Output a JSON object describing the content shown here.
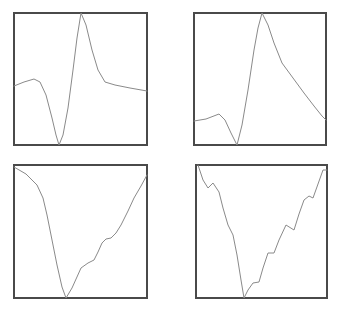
{
  "chart_data": [
    {
      "type": "line",
      "panel": "top-left",
      "title": "",
      "xlabel": "",
      "ylabel": "",
      "grid": false,
      "legend": null,
      "frame": {
        "x": 14,
        "y": 13,
        "w": 133,
        "h": 132
      },
      "points_px": [
        [
          14,
          86
        ],
        [
          24,
          82
        ],
        [
          34,
          79
        ],
        [
          40,
          82
        ],
        [
          46,
          95
        ],
        [
          52,
          118
        ],
        [
          56,
          135
        ],
        [
          59,
          145
        ],
        [
          63,
          135
        ],
        [
          68,
          108
        ],
        [
          73,
          70
        ],
        [
          77,
          38
        ],
        [
          81,
          13
        ],
        [
          86,
          25
        ],
        [
          92,
          50
        ],
        [
          98,
          70
        ],
        [
          105,
          82
        ],
        [
          115,
          85
        ],
        [
          130,
          88
        ],
        [
          147,
          91
        ]
      ],
      "description": "Smooth curve: small bump on left, deep trough, sharp peak, then gentle decay"
    },
    {
      "type": "line",
      "panel": "top-right",
      "title": "",
      "xlabel": "",
      "ylabel": "",
      "grid": false,
      "legend": null,
      "frame": {
        "x": 194,
        "y": 13,
        "w": 132,
        "h": 132
      },
      "points_px": [
        [
          194,
          121
        ],
        [
          206,
          119
        ],
        [
          219,
          114
        ],
        [
          225,
          120
        ],
        [
          231,
          133
        ],
        [
          237,
          145
        ],
        [
          242,
          125
        ],
        [
          248,
          90
        ],
        [
          254,
          50
        ],
        [
          258,
          28
        ],
        [
          262,
          13
        ],
        [
          268,
          25
        ],
        [
          274,
          43
        ],
        [
          282,
          63
        ],
        [
          293,
          78
        ],
        [
          304,
          93
        ],
        [
          314,
          106
        ],
        [
          322,
          116
        ],
        [
          326,
          120
        ]
      ],
      "description": "Small bump, trough, sharp peak, long linear-ish decay to the right"
    },
    {
      "type": "line",
      "panel": "bottom-left",
      "title": "",
      "xlabel": "",
      "ylabel": "",
      "grid": false,
      "legend": null,
      "frame": {
        "x": 14,
        "y": 165,
        "w": 133,
        "h": 133
      },
      "points_px": [
        [
          14,
          167
        ],
        [
          26,
          174
        ],
        [
          37,
          185
        ],
        [
          43,
          198
        ],
        [
          47,
          215
        ],
        [
          52,
          240
        ],
        [
          57,
          265
        ],
        [
          62,
          287
        ],
        [
          66,
          298
        ],
        [
          72,
          288
        ],
        [
          81,
          268
        ],
        [
          88,
          263
        ],
        [
          94,
          260
        ],
        [
          98,
          252
        ],
        [
          102,
          243
        ],
        [
          106,
          239
        ],
        [
          111,
          238
        ],
        [
          116,
          233
        ],
        [
          121,
          225
        ],
        [
          128,
          211
        ],
        [
          134,
          198
        ],
        [
          141,
          186
        ],
        [
          147,
          175
        ]
      ],
      "description": "V-shaped curve with a shallow shoulder on the rising right side"
    },
    {
      "type": "line",
      "panel": "bottom-right",
      "title": "",
      "xlabel": "",
      "ylabel": "",
      "grid": false,
      "legend": null,
      "frame": {
        "x": 196,
        "y": 165,
        "w": 131,
        "h": 133
      },
      "points_px": [
        [
          198,
          165
        ],
        [
          203,
          180
        ],
        [
          208,
          188
        ],
        [
          213,
          183
        ],
        [
          219,
          192
        ],
        [
          223,
          208
        ],
        [
          228,
          225
        ],
        [
          233,
          235
        ],
        [
          237,
          255
        ],
        [
          241,
          280
        ],
        [
          244,
          298
        ],
        [
          248,
          290
        ],
        [
          253,
          283
        ],
        [
          259,
          282
        ],
        [
          263,
          268
        ],
        [
          268,
          253
        ],
        [
          274,
          253
        ],
        [
          279,
          240
        ],
        [
          286,
          225
        ],
        [
          294,
          230
        ],
        [
          299,
          214
        ],
        [
          304,
          200
        ],
        [
          309,
          196
        ],
        [
          313,
          198
        ],
        [
          318,
          184
        ],
        [
          323,
          170
        ],
        [
          327,
          170
        ]
      ],
      "description": "V-shaped curve with periodic wiggles superimposed on both arms"
    }
  ],
  "colors": {
    "background": "#ffffff",
    "frame": "#4a4a4a",
    "curve": "#8a8a8a"
  }
}
